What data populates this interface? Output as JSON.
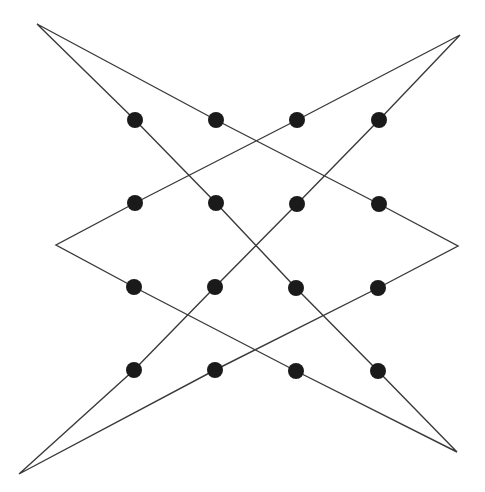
{
  "diagram": {
    "title": "",
    "background": "#ffffff",
    "line_color": "#3a3a3a",
    "dot_color": "#1a1a1a",
    "dot_radius": 8,
    "path_points": [
      [
        37,
        24
      ],
      [
        216,
        120
      ],
      [
        379,
        204
      ],
      [
        458,
        246
      ],
      [
        378,
        288
      ],
      [
        215,
        370
      ],
      [
        19,
        474
      ],
      [
        134,
        370
      ],
      [
        215,
        287
      ],
      [
        297,
        204
      ],
      [
        379,
        120
      ],
      [
        460,
        35
      ],
      [
        297,
        120
      ],
      [
        135,
        203
      ],
      [
        56,
        245
      ],
      [
        134,
        287
      ],
      [
        296,
        371
      ],
      [
        457,
        452
      ],
      [
        378,
        371
      ],
      [
        296,
        288
      ],
      [
        216,
        203
      ],
      [
        135,
        120
      ],
      [
        37,
        24
      ]
    ],
    "dots": [
      [
        135,
        120
      ],
      [
        216,
        120
      ],
      [
        297,
        120
      ],
      [
        379,
        120
      ],
      [
        135,
        203
      ],
      [
        216,
        203
      ],
      [
        297,
        204
      ],
      [
        379,
        204
      ],
      [
        134,
        287
      ],
      [
        215,
        287
      ],
      [
        296,
        288
      ],
      [
        378,
        288
      ],
      [
        134,
        370
      ],
      [
        215,
        370
      ],
      [
        296,
        371
      ],
      [
        378,
        371
      ]
    ]
  }
}
